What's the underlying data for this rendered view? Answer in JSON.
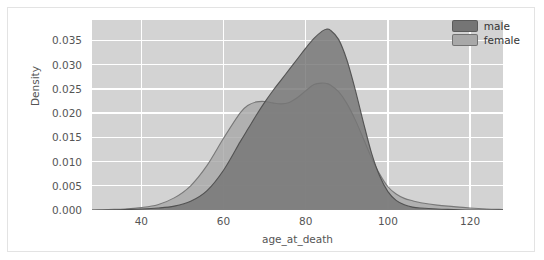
{
  "figure": {
    "background": "#ffffff",
    "plot_background": "#d3d3d3",
    "grid_color": "#ffffff"
  },
  "legend": {
    "position": "upper-right",
    "entries": [
      {
        "label": "male",
        "color": "#757575"
      },
      {
        "label": "female",
        "color": "#a8a8a8"
      }
    ]
  },
  "chart_data": {
    "type": "area",
    "title": "",
    "subtitle": "",
    "xlabel": "age_at_death",
    "ylabel": "Density",
    "xlim": [
      28,
      128
    ],
    "ylim": [
      0.0,
      0.0392
    ],
    "grid": true,
    "legend_position": "upper right",
    "xticks": [
      40,
      60,
      80,
      100,
      120
    ],
    "xtick_labels": [
      "40",
      "60",
      "80",
      "100",
      "120"
    ],
    "yticks": [
      0.0,
      0.005,
      0.01,
      0.015,
      0.02,
      0.025,
      0.03,
      0.035
    ],
    "ytick_labels": [
      "0.000",
      "0.005",
      "0.010",
      "0.015",
      "0.020",
      "0.025",
      "0.030",
      "0.035"
    ],
    "x": [
      28,
      32,
      36,
      40,
      44,
      48,
      52,
      56,
      60,
      64,
      66,
      68,
      70,
      72,
      74,
      76,
      78,
      80,
      82,
      84,
      85,
      86,
      88,
      90,
      92,
      94,
      96,
      98,
      100,
      102,
      104,
      106,
      108,
      112,
      116,
      120,
      124,
      128
    ],
    "series": [
      {
        "name": "male",
        "color": "#757575",
        "line_color": "#4a4a4a",
        "peak_x": 85,
        "peak_y": 0.0373,
        "values": [
          0.0,
          0.0,
          0.0001,
          0.0002,
          0.0004,
          0.0008,
          0.0018,
          0.004,
          0.0082,
          0.014,
          0.0168,
          0.0196,
          0.0222,
          0.0246,
          0.0268,
          0.029,
          0.0312,
          0.0334,
          0.0354,
          0.0369,
          0.0373,
          0.0371,
          0.0352,
          0.031,
          0.025,
          0.0182,
          0.0118,
          0.007,
          0.0038,
          0.002,
          0.0011,
          0.0006,
          0.0004,
          0.0002,
          0.0001,
          0.0,
          0.0,
          0.0
        ]
      },
      {
        "name": "female",
        "color": "#a8a8a8",
        "line_color": "#707070",
        "peak_x": 82,
        "peak_y": 0.0262,
        "secondary_peak_x": 69,
        "secondary_peak_y": 0.0224,
        "values": [
          0.0,
          0.0001,
          0.0002,
          0.0005,
          0.0011,
          0.0025,
          0.005,
          0.0092,
          0.0148,
          0.02,
          0.0216,
          0.0223,
          0.0224,
          0.0221,
          0.0219,
          0.0222,
          0.0232,
          0.0246,
          0.0259,
          0.0262,
          0.0261,
          0.0258,
          0.0244,
          0.022,
          0.0187,
          0.0148,
          0.0108,
          0.0074,
          0.0048,
          0.0033,
          0.0024,
          0.0019,
          0.0015,
          0.001,
          0.0007,
          0.0004,
          0.0002,
          0.0001
        ]
      }
    ]
  }
}
